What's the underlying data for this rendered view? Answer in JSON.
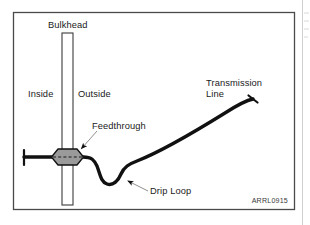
{
  "figure": {
    "credit": "ARRL0915",
    "frame": {
      "x": 13,
      "y": 12,
      "width": 282,
      "height": 198,
      "stroke": "#4a4a4a"
    },
    "background": "#ffffff"
  },
  "labels": {
    "bulkhead": "Bulkhead",
    "inside": "Inside",
    "outside": "Outside",
    "feedthrough": "Feedthrough",
    "drip_loop": "Drip Loop",
    "transmission_line_1": "Transmission",
    "transmission_line_2": "Line"
  },
  "label_positions": {
    "bulkhead": {
      "x": 48,
      "y": 28,
      "anchor": "start"
    },
    "inside": {
      "x": 28,
      "y": 97,
      "anchor": "start"
    },
    "outside": {
      "x": 78,
      "y": 97,
      "anchor": "start"
    },
    "feedthrough": {
      "x": 92,
      "y": 129,
      "anchor": "start"
    },
    "drip_loop": {
      "x": 150,
      "y": 194,
      "anchor": "start"
    },
    "transmission_line_1": {
      "x": 206,
      "y": 86,
      "anchor": "start"
    },
    "transmission_line_2": {
      "x": 206,
      "y": 97,
      "anchor": "start"
    },
    "credit": {
      "x": 288,
      "y": 203,
      "anchor": "end"
    }
  },
  "bulkhead": {
    "x": 62,
    "y": 33,
    "width": 11,
    "height": 172,
    "fill": "#ffffff",
    "stroke": "#3b3b3b",
    "hatch_color": "#6b6b6b",
    "hatch_spacing": 6
  },
  "feedthrough": {
    "center_x": 67.5,
    "center_y": 157,
    "half_width": 16,
    "half_height": 8,
    "shoulder": 6,
    "fill": "#9a9a9a",
    "stroke": "#111111",
    "centerline_stroke": "#1a1a1a"
  },
  "cable": {
    "stroke": "#111111",
    "stroke_width": 3.4,
    "left_end": {
      "x": 24,
      "y": 157
    },
    "left_endcap": {
      "x": 24,
      "y1": 150,
      "y2": 165
    },
    "right_end": {
      "x": 253,
      "y": 99
    },
    "right_endcap": {
      "x1": 248,
      "y1": 95,
      "x2": 258,
      "y2": 103
    },
    "path": "M 24 157 L 83 157 C 92 157 94 160 97 166 C 100 174 101 182 107 184 C 113 186 118 181 121 174 C 124 167 129 164 137 161 C 160 152 196 131 225 113 C 239 104 248 100 253 99"
  },
  "leaders": [
    {
      "name": "feedthrough-leader",
      "from": {
        "x": 97,
        "y": 131
      },
      "to": {
        "x": 80,
        "y": 150
      },
      "arrow_at": "to",
      "stroke": "#8a8a8a"
    },
    {
      "name": "drip-loop-leader",
      "from": {
        "x": 148,
        "y": 191
      },
      "to": {
        "x": 126,
        "y": 180
      },
      "arrow_at": "to",
      "stroke": "#8a8a8a"
    }
  ],
  "artifacts": {
    "page_edge_x": 302,
    "faint_marks": [
      {
        "x1": 304,
        "y1": 13,
        "x2": 309,
        "y2": 13
      },
      {
        "x1": 304,
        "y1": 21,
        "x2": 309,
        "y2": 21
      },
      {
        "x1": 304,
        "y1": 29,
        "x2": 309,
        "y2": 29
      },
      {
        "x1": 304,
        "y1": 37,
        "x2": 308,
        "y2": 37
      }
    ]
  }
}
